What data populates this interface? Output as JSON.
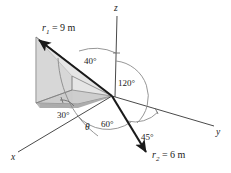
{
  "figure": {
    "background_color": "#ffffff",
    "axes": {
      "x_label": "x",
      "y_label": "y",
      "z_label": "z"
    },
    "vectors": [
      {
        "name": "r1",
        "label_prefix": "r",
        "label_subscript": "1",
        "label_value": "= 9 m",
        "label_full": "r1 = 9 m",
        "magnitude": 9,
        "unit": "m"
      },
      {
        "name": "r2",
        "label_prefix": "r",
        "label_subscript": "2",
        "label_value": "= 6 m",
        "label_full": "r2 = 6 m",
        "magnitude": 6,
        "unit": "m"
      }
    ],
    "angles": [
      {
        "name": "angle-40",
        "label": "40°",
        "value": 40
      },
      {
        "name": "angle-120",
        "label": "120°",
        "value": 120
      },
      {
        "name": "angle-60",
        "label": "60°",
        "value": 60
      },
      {
        "name": "angle-45",
        "label": "45°",
        "value": 45
      },
      {
        "name": "angle-30",
        "label": "30°",
        "value": 30
      },
      {
        "name": "angle-theta",
        "label": "θ",
        "value": null
      }
    ],
    "colors": {
      "vector_stroke": "#1a1a1a",
      "axis_stroke": "#4a4a4a",
      "arc_stroke": "#8a8a8a",
      "wedge_top_fill": "#d4d4d4",
      "wedge_side_fill": "#dcdcdc",
      "wedge_base_fill": "#b0b0b0"
    }
  }
}
